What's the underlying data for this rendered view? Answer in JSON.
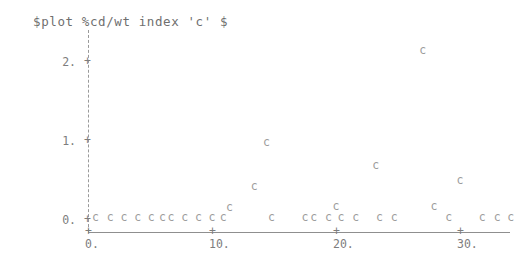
{
  "title": "$plot %cd/wt index 'c' $",
  "colors": {
    "background": "#ffffff",
    "text": "#6f6f6f",
    "axis": "#8f8f8f",
    "marker": "#9c9c9c"
  },
  "axes": {
    "y_tick_mark": "+",
    "x_tick_mark": "+",
    "y_ticks": [
      {
        "label": "0.",
        "value": 0
      },
      {
        "label": "1.",
        "value": 1
      },
      {
        "label": "2.",
        "value": 2
      }
    ],
    "x_ticks": [
      {
        "label": "0.",
        "value": 0
      },
      {
        "label": "10.",
        "value": 10
      },
      {
        "label": "20.",
        "value": 20
      },
      {
        "label": "30.",
        "value": 30
      }
    ]
  },
  "chart_data": {
    "type": "scatter",
    "title": "$plot %cd/wt index 'c' $",
    "xlabel": "",
    "ylabel": "",
    "marker": "c",
    "grid": false,
    "legend": null,
    "xlim": [
      -0.8,
      34.5
    ],
    "ylim": [
      0.0,
      2.45
    ],
    "x_ticks": [
      0,
      10,
      20,
      30
    ],
    "y_ticks": [
      0,
      1,
      2
    ],
    "x_tick_labels": [
      "0.",
      "10.",
      "20.",
      "30."
    ],
    "y_tick_labels": [
      "0.",
      "1.",
      "2."
    ],
    "points": [
      {
        "x": 0.6,
        "y": 0.02
      },
      {
        "x": 1.8,
        "y": 0.02
      },
      {
        "x": 2.9,
        "y": 0.02
      },
      {
        "x": 4.0,
        "y": 0.02
      },
      {
        "x": 5.1,
        "y": 0.02
      },
      {
        "x": 6.0,
        "y": 0.02
      },
      {
        "x": 6.7,
        "y": 0.02
      },
      {
        "x": 7.8,
        "y": 0.02
      },
      {
        "x": 8.9,
        "y": 0.02
      },
      {
        "x": 10.0,
        "y": 0.02
      },
      {
        "x": 10.9,
        "y": 0.02
      },
      {
        "x": 11.4,
        "y": 0.15
      },
      {
        "x": 13.4,
        "y": 0.42
      },
      {
        "x": 14.4,
        "y": 0.97
      },
      {
        "x": 14.8,
        "y": 0.02
      },
      {
        "x": 17.5,
        "y": 0.02
      },
      {
        "x": 18.2,
        "y": 0.02
      },
      {
        "x": 19.4,
        "y": 0.02
      },
      {
        "x": 20.4,
        "y": 0.02
      },
      {
        "x": 21.6,
        "y": 0.02
      },
      {
        "x": 20.0,
        "y": 0.17
      },
      {
        "x": 23.2,
        "y": 0.68
      },
      {
        "x": 23.5,
        "y": 0.02
      },
      {
        "x": 24.7,
        "y": 0.02
      },
      {
        "x": 27.0,
        "y": 2.14
      },
      {
        "x": 27.9,
        "y": 0.17
      },
      {
        "x": 30.0,
        "y": 0.5
      },
      {
        "x": 29.1,
        "y": 0.02
      },
      {
        "x": 31.8,
        "y": 0.02
      },
      {
        "x": 33.0,
        "y": 0.02
      },
      {
        "x": 34.1,
        "y": 0.02
      }
    ]
  },
  "geometry": {
    "x_origin_px": 88,
    "y_origin_px": 220,
    "px_per_x_unit": 12.4,
    "px_per_y_unit": 79
  }
}
